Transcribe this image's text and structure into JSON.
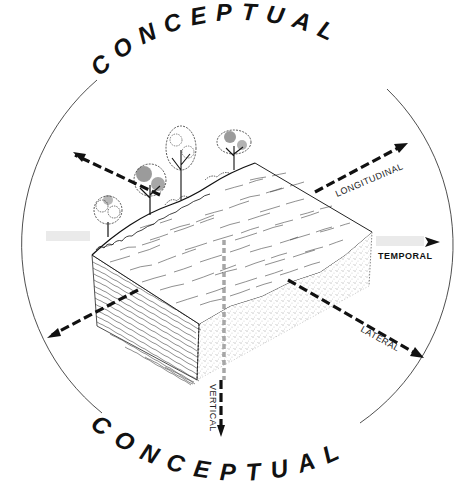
{
  "diagram": {
    "top_title": "CONCEPTUAL",
    "bottom_title": "CONCEPTUAL",
    "colors": {
      "ink": "#111111",
      "circle": "#444444",
      "background": "#ffffff"
    },
    "axes": [
      {
        "id": "longitudinal",
        "label": "LONGITUDINAL",
        "icon": "dashed-arrow-icon"
      },
      {
        "id": "temporal",
        "label": "TEMPORAL",
        "icon": "hatched-arrow-icon"
      },
      {
        "id": "lateral",
        "label": "LATERAL",
        "icon": "dashed-arrow-icon"
      },
      {
        "id": "vertical",
        "label": "VERTICAL",
        "icon": "dashed-arrow-icon"
      }
    ],
    "illustration": {
      "subject": "stream-block",
      "elements": [
        "riparian-trees",
        "water-surface",
        "streambed-sediment",
        "hyporheic-zone"
      ]
    }
  }
}
